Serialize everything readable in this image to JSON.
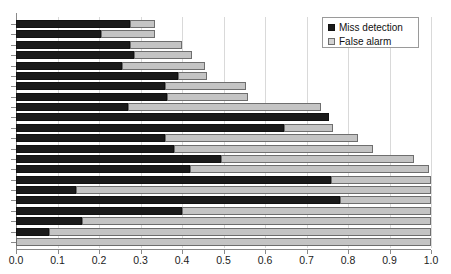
{
  "chart_data": {
    "type": "bar",
    "orientation": "horizontal",
    "stacked": true,
    "title": "",
    "subtitle": "",
    "xlabel": "",
    "ylabel": "",
    "xlim": [
      0.0,
      1.0
    ],
    "grid": true,
    "grid_axis": "x",
    "legend_position": "top-right",
    "xticks": [
      0.0,
      0.1,
      0.2,
      0.3,
      0.4,
      0.5,
      0.6,
      0.7,
      0.8,
      0.9,
      1.0
    ],
    "xticklabels": [
      "0.0",
      "0.1",
      "0.2",
      "0.3",
      "0.4",
      "0.5",
      "0.6",
      "0.7",
      "0.8",
      "0.9",
      "1.0"
    ],
    "yticklabels": [],
    "categories": [
      "1",
      "2",
      "3",
      "4",
      "5",
      "6",
      "7",
      "8",
      "9",
      "10",
      "11",
      "12",
      "13",
      "14",
      "15",
      "16",
      "17",
      "18",
      "19",
      "20",
      "21",
      "22"
    ],
    "series": [
      {
        "name": "Miss detection",
        "color": "#1a1a1a",
        "values": [
          0.275,
          0.205,
          0.275,
          0.285,
          0.255,
          0.39,
          0.36,
          0.365,
          0.27,
          0.755,
          0.645,
          0.36,
          0.38,
          0.495,
          0.42,
          0.76,
          0.145,
          0.78,
          0.4,
          0.16,
          0.08,
          0.0
        ]
      },
      {
        "name": "False alarm",
        "color": "#c4c4c4",
        "values": [
          0.06,
          0.13,
          0.125,
          0.14,
          0.2,
          0.07,
          0.195,
          0.195,
          0.465,
          0.0,
          0.12,
          0.465,
          0.48,
          0.465,
          0.575,
          0.24,
          0.855,
          0.22,
          0.6,
          0.84,
          0.92,
          1.0
        ]
      }
    ],
    "totals": [
      0.335,
      0.335,
      0.4,
      0.425,
      0.455,
      0.46,
      0.555,
      0.56,
      0.735,
      0.755,
      0.765,
      0.825,
      0.86,
      0.96,
      0.995,
      1.0,
      1.0,
      1.0,
      1.0,
      1.0,
      1.0,
      1.0
    ]
  },
  "legend": {
    "items": [
      {
        "label": "Miss detection",
        "swatch": "dark-square-icon"
      },
      {
        "label": "False alarm",
        "swatch": "light-square-icon"
      }
    ]
  },
  "colors": {
    "miss_detection": "#1a1a1a",
    "false_alarm": "#c4c4c4",
    "axis": "#8a8a8a",
    "gridline": "#d9d9d9",
    "background": "#ffffff",
    "text": "#1c1c1c"
  }
}
